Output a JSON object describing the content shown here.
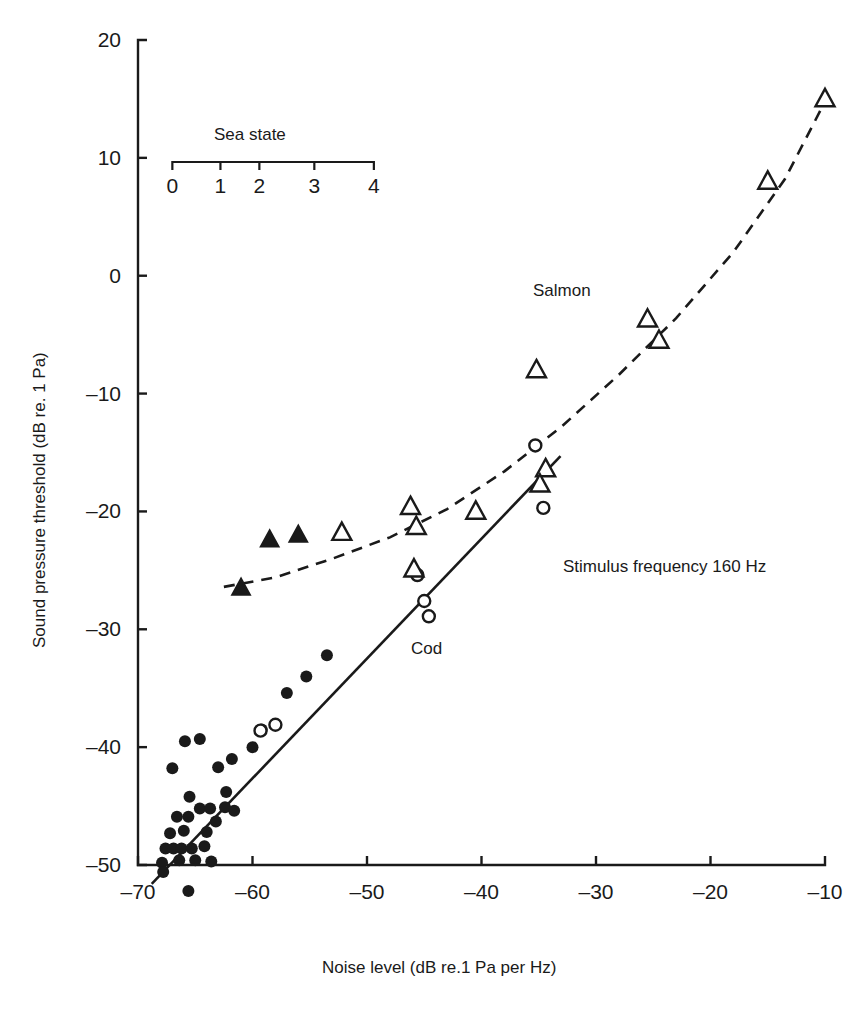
{
  "figure": {
    "background": "#ffffff",
    "ink_color": "#1a1a1a"
  },
  "axes": {
    "x_title": "Noise level (dB re.1 Pa per Hz)",
    "y_title": "Sound pressure threshold (dB re. 1 Pa)",
    "x_ticks": [
      "-70",
      "-60",
      "-50",
      "-40",
      "-30",
      "-20",
      "-10"
    ],
    "y_ticks": [
      "20",
      "10",
      "0",
      "-10",
      "-20",
      "-30",
      "-40",
      "-50"
    ]
  },
  "secondary_axis": {
    "title": "Sea  state",
    "ticks": [
      "0",
      "1",
      "2",
      "3",
      "4"
    ]
  },
  "annotations": {
    "salmon": "Salmon",
    "cod": "Cod",
    "stimulus": "Stimulus frequency 160 Hz"
  },
  "chart_data": {
    "type": "scatter",
    "title": "",
    "xlabel": "Noise level (dB re.1 Pa per Hz)",
    "ylabel": "Sound pressure threshold (dB re. 1 Pa)",
    "xlim": [
      -70,
      -10
    ],
    "ylim": [
      -50,
      20
    ],
    "xticks": [
      -70,
      -60,
      -50,
      -40,
      -30,
      -20,
      -10
    ],
    "yticks": [
      -50,
      -40,
      -30,
      -20,
      -10,
      0,
      10,
      20
    ],
    "grid": false,
    "legend": "inline-labels",
    "secondary_x_axis": {
      "label": "Sea  state",
      "tick_labels": [
        0,
        1,
        2,
        3,
        4
      ],
      "tick_noise_levels": [
        -67.0,
        -62.8,
        -59.4,
        -54.6,
        -49.4
      ]
    },
    "series": [
      {
        "name": "Cod (filled circles)",
        "marker": "filled-circle",
        "points": [
          [
            -65.9,
            -39.5
          ],
          [
            -64.6,
            -39.3
          ],
          [
            -67.0,
            -41.8
          ],
          [
            -63.0,
            -41.7
          ],
          [
            -62.3,
            -43.8
          ],
          [
            -65.5,
            -44.2
          ],
          [
            -64.6,
            -45.2
          ],
          [
            -63.7,
            -45.2
          ],
          [
            -66.6,
            -45.9
          ],
          [
            -65.6,
            -45.9
          ],
          [
            -67.2,
            -47.3
          ],
          [
            -66.0,
            -47.1
          ],
          [
            -64.0,
            -47.2
          ],
          [
            -63.2,
            -46.3
          ],
          [
            -67.6,
            -48.6
          ],
          [
            -66.9,
            -48.6
          ],
          [
            -66.2,
            -48.6
          ],
          [
            -65.3,
            -48.6
          ],
          [
            -64.2,
            -48.4
          ],
          [
            -67.9,
            -49.8
          ],
          [
            -66.4,
            -49.6
          ],
          [
            -65.0,
            -49.6
          ],
          [
            -63.6,
            -49.7
          ],
          [
            -67.8,
            -50.6
          ],
          [
            -65.6,
            -52.2
          ],
          [
            -61.8,
            -41.0
          ],
          [
            -60.0,
            -40.0
          ],
          [
            -59.2,
            -38.5
          ],
          [
            -57.0,
            -35.4
          ],
          [
            -55.3,
            -34.0
          ],
          [
            -53.5,
            -32.2
          ],
          [
            -62.4,
            -45.1
          ],
          [
            -61.6,
            -45.4
          ]
        ]
      },
      {
        "name": "Cod (open circles)",
        "marker": "open-circle",
        "points": [
          [
            -59.3,
            -38.6
          ],
          [
            -58.0,
            -38.1
          ],
          [
            -45.6,
            -25.4
          ],
          [
            -45.0,
            -27.6
          ],
          [
            -44.6,
            -28.9
          ],
          [
            -35.3,
            -14.4
          ],
          [
            -34.6,
            -19.7
          ]
        ]
      },
      {
        "name": "Salmon (filled triangles)",
        "marker": "filled-triangle",
        "points": [
          [
            -58.5,
            -22.4
          ],
          [
            -56.0,
            -22.0
          ],
          [
            -61.0,
            -26.5
          ]
        ]
      },
      {
        "name": "Salmon (open triangles)",
        "marker": "open-triangle",
        "points": [
          [
            -52.2,
            -21.8
          ],
          [
            -46.2,
            -19.6
          ],
          [
            -45.7,
            -21.3
          ],
          [
            -45.9,
            -24.9
          ],
          [
            -40.5,
            -20.0
          ],
          [
            -35.2,
            -8.0
          ],
          [
            -34.4,
            -16.4
          ],
          [
            -34.9,
            -17.7
          ],
          [
            -25.5,
            -3.7
          ],
          [
            -24.5,
            -5.5
          ],
          [
            -15.0,
            8.0
          ],
          [
            -10.0,
            15.0
          ]
        ]
      }
    ],
    "fits": [
      {
        "name": "Cod regression",
        "style": "solid",
        "endpoints": [
          [
            -68.8,
            -51.6
          ],
          [
            -33.1,
            -15.3
          ]
        ]
      },
      {
        "name": "Salmon curve",
        "style": "dashed",
        "curve_points": [
          [
            -62.5,
            -26.4
          ],
          [
            -58.0,
            -25.6
          ],
          [
            -53.0,
            -24.0
          ],
          [
            -48.0,
            -22.2
          ],
          [
            -43.0,
            -19.8
          ],
          [
            -38.0,
            -16.6
          ],
          [
            -33.0,
            -12.8
          ],
          [
            -28.0,
            -8.4
          ],
          [
            -23.0,
            -3.6
          ],
          [
            -18.0,
            2.0
          ],
          [
            -13.5,
            8.2
          ],
          [
            -10.2,
            14.4
          ]
        ]
      }
    ]
  }
}
